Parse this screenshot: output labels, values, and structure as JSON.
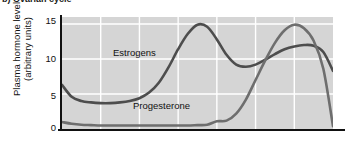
{
  "caption": "b) Ovarian cycle",
  "axis": {
    "y_title_line1": "Plasma hormone level",
    "y_title_line2": "(arbitrary units)",
    "y_ticks": [
      "15",
      "10",
      "5",
      "0"
    ]
  },
  "labels": {
    "estrogens": "Estrogens",
    "progesterone": "Progesterone"
  },
  "colors": {
    "panel_background": "#d5d5d5",
    "gridline": "#ffffff",
    "estrogens_curve": "#4d4d4d",
    "progesterone_curve": "#6e6e6e",
    "axis": "#111111",
    "page_background": "#ffffff"
  },
  "chart_data": {
    "type": "line",
    "title": "b) Ovarian cycle",
    "xlabel": "",
    "ylabel": "Plasma hormone level (arbitrary units)",
    "ylim": [
      0,
      16
    ],
    "xlim": [
      0,
      28
    ],
    "yticks": [
      0,
      5,
      10,
      15
    ],
    "grid": true,
    "legend": "inline-labels",
    "x": [
      0,
      1,
      2,
      3,
      4,
      5,
      6,
      7,
      8,
      9,
      10,
      11,
      12,
      13,
      14,
      15,
      16,
      17,
      18,
      19,
      20,
      21,
      22,
      23,
      24,
      25,
      26,
      27,
      28
    ],
    "series": [
      {
        "name": "Estrogens",
        "values": [
          6.3,
          4.6,
          4.0,
          3.8,
          3.7,
          3.7,
          3.8,
          4.0,
          4.4,
          5.2,
          6.6,
          8.8,
          11.4,
          13.6,
          14.9,
          14.6,
          12.8,
          10.6,
          9.2,
          8.9,
          9.2,
          9.9,
          10.7,
          11.4,
          11.8,
          12.0,
          11.9,
          11.0,
          8.3
        ]
      },
      {
        "name": "Progesterone",
        "values": [
          1.0,
          0.75,
          0.6,
          0.55,
          0.5,
          0.5,
          0.5,
          0.5,
          0.5,
          0.5,
          0.5,
          0.5,
          0.5,
          0.5,
          0.55,
          0.6,
          1.1,
          1.2,
          2.2,
          4.2,
          7.0,
          9.8,
          12.3,
          14.1,
          14.9,
          14.4,
          12.6,
          8.6,
          0.4
        ]
      }
    ]
  }
}
